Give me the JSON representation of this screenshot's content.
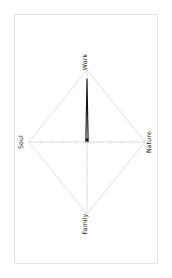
{
  "chart_data": {
    "type": "radar",
    "title": "",
    "subtitle": "",
    "xlabel": "",
    "ylabel": "",
    "categories": [
      "Work",
      "Nature",
      "Family",
      "Soul"
    ],
    "series": [
      {
        "name": "",
        "values": [
          0.88,
          0.02,
          -0.04,
          0.02
        ]
      }
    ],
    "rlim": [
      0,
      1
    ],
    "rticks": [
      0.2,
      0.4,
      0.6,
      0.8,
      1.0
    ],
    "grid": true,
    "legend": false,
    "legend_position": "none",
    "annotations": [],
    "axis_label_rotation": 90,
    "grid_color": "#bdbdbd",
    "outer_ring_color": "#c9c9c9",
    "data_line_color": "#111111",
    "frame_color": "#e2e2e2",
    "background_color": "#ffffff"
  },
  "figure": {
    "frame_visible": true,
    "labels": {
      "top": "Work",
      "right": "Nature",
      "bottom": "Family",
      "left": "Soul"
    }
  }
}
